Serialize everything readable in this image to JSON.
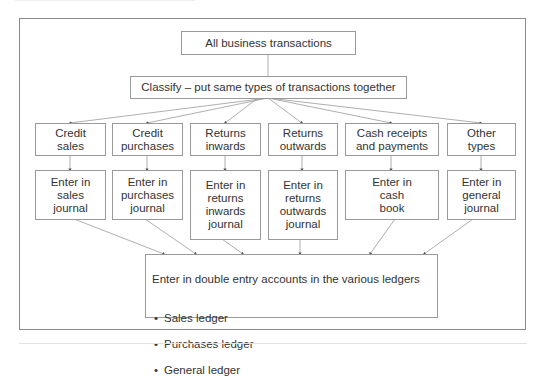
{
  "diagram": {
    "root": "All business transactions",
    "classify": "Classify – put same types of transactions together",
    "categories": [
      {
        "label": "Credit\nsales",
        "journal": "Enter in\nsales\njournal"
      },
      {
        "label": "Credit\npurchases",
        "journal": "Enter in\npurchases\njournal"
      },
      {
        "label": "Returns\ninwards",
        "journal": "Enter in\nreturns\ninwards\njournal"
      },
      {
        "label": "Returns\noutwards",
        "journal": "Enter in\nreturns\noutwards\njournal"
      },
      {
        "label": "Cash receipts\nand payments",
        "journal": "Enter in\ncash\nbook"
      },
      {
        "label": "Other\ntypes",
        "journal": "Enter in\ngeneral\njournal"
      }
    ],
    "ledgers": {
      "title": "Enter in double entry accounts in the various ledgers",
      "items": [
        "Sales ledger",
        "Purchases ledger",
        "General ledger"
      ]
    },
    "colors": {
      "border": "#9a9a9a",
      "line": "#8a8a8a",
      "text": "#333333"
    }
  }
}
